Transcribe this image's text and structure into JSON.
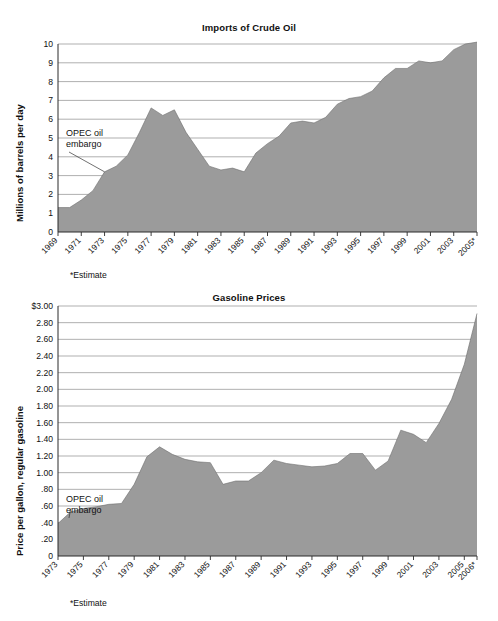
{
  "page": {
    "background": "#ffffff",
    "fill_color": "#9b9b9b",
    "grid_color": "#8e8e8e",
    "axis_color": "#2a2a2a"
  },
  "charts": [
    {
      "id": "imports-of-crude-oil",
      "title": "Imports of Crude Oil",
      "ylabel": "Millions of barrels per day",
      "footnote": "*Estimate",
      "annotation": {
        "line1": "OPEC oil",
        "line2": "embargo",
        "year": 1973
      },
      "ytick_labels": [
        "10",
        "9",
        "8",
        "7",
        "6",
        "5",
        "4",
        "3",
        "2",
        "1",
        "0"
      ],
      "xtick_labels": [
        "1969",
        "1971",
        "1973",
        "1975",
        "1977",
        "1979",
        "1981",
        "1983",
        "1985",
        "1987",
        "1989",
        "1991",
        "1993",
        "1995",
        "1997",
        "1999",
        "2001",
        "2003",
        "2005*"
      ]
    },
    {
      "id": "gasoline-prices",
      "title": "Gasoline Prices",
      "ylabel": "Price per gallon, regular gasoline",
      "footnote": "*Estimate",
      "annotation": {
        "line1": "OPEC oil",
        "line2": "embargo",
        "year": 1974
      },
      "ytick_labels": [
        "$3.00",
        "2.80",
        "2.60",
        "2.40",
        "2.20",
        "2.00",
        "1.80",
        "1.60",
        "1.40",
        "1.20",
        "1.00",
        ".80",
        ".60",
        ".40",
        ".20",
        "0"
      ],
      "xtick_labels": [
        "1973",
        "1975",
        "1977",
        "1979",
        "1981",
        "1983",
        "1985",
        "1987",
        "1989",
        "1991",
        "1993",
        "1995",
        "1997",
        "1999",
        "2001",
        "2003",
        "2005",
        "2006*"
      ]
    }
  ],
  "chart_data": [
    {
      "type": "area",
      "title": "Imports of Crude Oil",
      "xlabel": "",
      "ylabel": "Millions of barrels per day",
      "ylim": [
        0,
        10
      ],
      "xlim": [
        1969,
        2005
      ],
      "grid": true,
      "legend": "none",
      "annotations": [
        {
          "text": "OPEC oil embargo",
          "x": 1973,
          "y": 3.2
        }
      ],
      "footnote": "*Estimate",
      "x": [
        1969,
        1970,
        1971,
        1972,
        1973,
        1974,
        1975,
        1976,
        1977,
        1978,
        1979,
        1980,
        1981,
        1982,
        1983,
        1984,
        1985,
        1986,
        1987,
        1988,
        1989,
        1990,
        1991,
        1992,
        1993,
        1994,
        1995,
        1996,
        1997,
        1998,
        1999,
        2000,
        2001,
        2002,
        2003,
        2004,
        2005
      ],
      "values": [
        1.3,
        1.3,
        1.7,
        2.2,
        3.2,
        3.5,
        4.1,
        5.3,
        6.6,
        6.2,
        6.5,
        5.3,
        4.4,
        3.5,
        3.3,
        3.4,
        3.2,
        4.2,
        4.7,
        5.1,
        5.8,
        5.9,
        5.8,
        6.1,
        6.8,
        7.1,
        7.2,
        7.5,
        8.2,
        8.7,
        8.7,
        9.1,
        9.0,
        9.1,
        9.7,
        10.0,
        10.1
      ]
    },
    {
      "type": "area",
      "title": "Gasoline Prices",
      "xlabel": "",
      "ylabel": "Price per gallon, regular gasoline",
      "ylim": [
        0,
        3.0
      ],
      "xlim": [
        1973,
        2006
      ],
      "grid": true,
      "legend": "none",
      "annotations": [
        {
          "text": "OPEC oil embargo",
          "x": 1974,
          "y": 0.57
        }
      ],
      "footnote": "*Estimate",
      "x": [
        1973,
        1974,
        1975,
        1976,
        1977,
        1978,
        1979,
        1980,
        1981,
        1982,
        1983,
        1984,
        1985,
        1986,
        1987,
        1988,
        1989,
        1990,
        1991,
        1992,
        1993,
        1994,
        1995,
        1996,
        1997,
        1998,
        1999,
        2000,
        2001,
        2002,
        2003,
        2004,
        2005,
        2006
      ],
      "values": [
        0.39,
        0.53,
        0.57,
        0.59,
        0.62,
        0.63,
        0.86,
        1.19,
        1.31,
        1.22,
        1.16,
        1.13,
        1.12,
        0.86,
        0.9,
        0.9,
        1.0,
        1.15,
        1.11,
        1.09,
        1.07,
        1.08,
        1.11,
        1.23,
        1.23,
        1.03,
        1.14,
        1.51,
        1.46,
        1.36,
        1.59,
        1.88,
        2.3,
        2.91
      ]
    }
  ]
}
